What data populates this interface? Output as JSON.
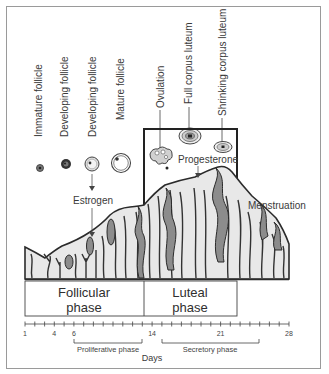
{
  "diagram": {
    "type": "menstrual-cycle-diagram",
    "stage_labels": [
      {
        "id": "immature-follicle",
        "label": "Immature follicle"
      },
      {
        "id": "developing-follicle-1",
        "label": "Developing follicle"
      },
      {
        "id": "developing-follicle-2",
        "label": "Developing follicle"
      },
      {
        "id": "mature-follicle",
        "label": "Mature follicle"
      },
      {
        "id": "ovulation",
        "label": "Ovulation"
      },
      {
        "id": "full-corpus-luteum",
        "label": "Full corpus luteum"
      },
      {
        "id": "shrinking-corpus-luteum",
        "label": "Shrinking corpus luteum"
      }
    ],
    "hormones": {
      "estrogen": "Estrogen",
      "progesterone": "Progesterone"
    },
    "event_labels": {
      "menstruation": "Menstruation"
    },
    "phases": {
      "follicular": {
        "line1": "Follicular",
        "line2": "phase"
      },
      "luteal": {
        "line1": "Luteal",
        "line2": "phase"
      }
    },
    "axis": {
      "label": "Days",
      "min": 1,
      "max": 28,
      "tick_labels": [
        "1",
        "4",
        "6",
        "14",
        "21",
        "28"
      ]
    },
    "sub_phases": {
      "proliferative": {
        "label": "Proliferative phase",
        "start_day": 6,
        "end_day": 14
      },
      "secretory": {
        "label": "Secretory phase",
        "start_day": 15,
        "end_day": 26
      }
    },
    "colors": {
      "line": "#2b2b2b",
      "tissue_fill": "#e8e8e8",
      "gland_fill": "#8c8c8c",
      "text": "#3a3a3a"
    }
  }
}
